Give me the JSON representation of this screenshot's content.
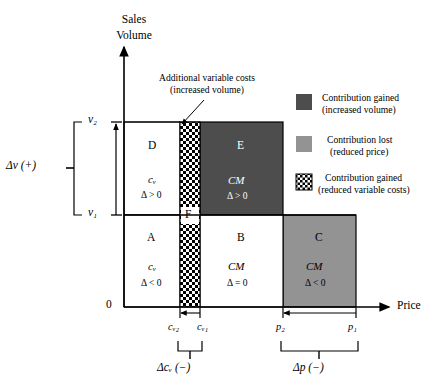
{
  "figure": {
    "type": "diagram",
    "subtype": "price-volume contribution-margin waterfall box diagram",
    "background": "#ffffff"
  },
  "axes": {
    "y_title_line1": "Sales",
    "y_title_line2": "Volume",
    "x_title": "Price",
    "origin_label": "0",
    "y_ticks": [
      "v₂",
      "v₁"
    ],
    "x_ticks": [
      "cᵥ₂",
      "cᵥ₁",
      "p₂",
      "p₁"
    ]
  },
  "brackets": {
    "vertical_label": "Δv (+)",
    "cost_label": "Δcᵥ (−)",
    "price_label": "Δp (−)"
  },
  "annotation": {
    "line1": "Additional variable costs",
    "line2": "(increased volume)"
  },
  "regions": [
    {
      "id": "D",
      "letter": "D",
      "sub": "cᵥ",
      "delta": "Δ > 0",
      "fill": "#ffffff",
      "text_color": "#000000"
    },
    {
      "id": "E",
      "letter": "E",
      "sub": "CM",
      "delta": "Δ > 0",
      "fill": "#4d4d4d",
      "text_color": "#ffffff"
    },
    {
      "id": "F",
      "letter": "F",
      "sub": "",
      "delta": "",
      "fill": "checker",
      "text_color": "#000000"
    },
    {
      "id": "A",
      "letter": "A",
      "sub": "cᵥ",
      "delta": "Δ < 0",
      "fill": "#ffffff",
      "text_color": "#000000"
    },
    {
      "id": "B",
      "letter": "B",
      "sub": "CM",
      "delta": "Δ = 0",
      "fill": "#ffffff",
      "text_color": "#000000"
    },
    {
      "id": "C",
      "letter": "C",
      "sub": "CM",
      "delta": "Δ < 0",
      "fill": "#939393",
      "text_color": "#000000"
    }
  ],
  "legend": [
    {
      "swatch": "dark-solid",
      "color": "#4d4d4d",
      "line1": "Contribution gained",
      "line2": "(increased volume)"
    },
    {
      "swatch": "light-solid",
      "color": "#939393",
      "line1": "Contribution lost",
      "line2": "(reduced price)"
    },
    {
      "swatch": "checker",
      "color": "#000000",
      "line1": "Contribution gained",
      "line2": "(reduced variable costs)"
    }
  ],
  "colors": {
    "dark_gray": "#4d4d4d",
    "mid_gray": "#939393",
    "white": "#ffffff",
    "black": "#000000"
  }
}
